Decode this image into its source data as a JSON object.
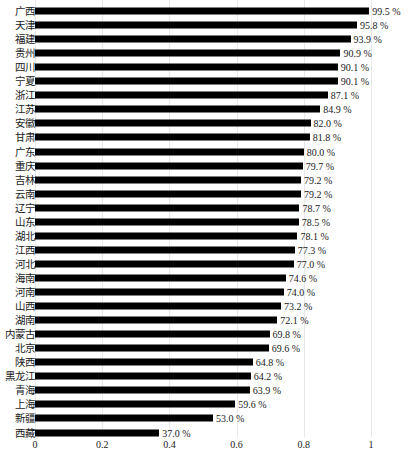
{
  "chart_data": {
    "type": "bar",
    "orientation": "horizontal",
    "title": "",
    "subtitle": "",
    "xlabel": "",
    "ylabel": "",
    "xlim": [
      0,
      1
    ],
    "xticks": [
      "0",
      "0.2",
      "0.4",
      "0.6",
      "0.8",
      "1"
    ],
    "xtick_values": [
      0,
      0.2,
      0.4,
      0.6,
      0.8,
      1
    ],
    "grid": "vertical",
    "legend": "none",
    "bar_color": "#000000",
    "label_suffix": " %",
    "categories": [
      "广西",
      "天津",
      "福建",
      "贵州",
      "四川",
      "宁夏",
      "浙江",
      "江苏",
      "安徽",
      "甘肃",
      "广东",
      "重庆",
      "吉林",
      "云南",
      "辽宁",
      "山东",
      "湖北",
      "江西",
      "河北",
      "海南",
      "河南",
      "山西",
      "湖南",
      "内蒙古",
      "北京",
      "陕西",
      "黑龙江",
      "青海",
      "上海",
      "新疆",
      "西藏"
    ],
    "values": [
      0.995,
      0.958,
      0.939,
      0.909,
      0.901,
      0.901,
      0.871,
      0.849,
      0.82,
      0.818,
      0.8,
      0.797,
      0.792,
      0.792,
      0.787,
      0.785,
      0.781,
      0.773,
      0.77,
      0.746,
      0.74,
      0.732,
      0.721,
      0.698,
      0.696,
      0.648,
      0.642,
      0.639,
      0.596,
      0.53,
      0.37
    ],
    "data_labels": [
      "99.5 %",
      "95.8 %",
      "93.9 %",
      "90.9 %",
      "90.1 %",
      "90.1 %",
      "87.1 %",
      "84.9 %",
      "82.0 %",
      "81.8 %",
      "80.0 %",
      "79.7 %",
      "79.2 %",
      "79.2 %",
      "78.7 %",
      "78.5 %",
      "78.1 %",
      "77.3 %",
      "77.0 %",
      "74.6 %",
      "74.0 %",
      "73.2 %",
      "72.1 %",
      "69.8 %",
      "69.6 %",
      "64.8 %",
      "64.2 %",
      "63.9 %",
      "59.6 %",
      "53.0 %",
      "37.0 %"
    ]
  }
}
